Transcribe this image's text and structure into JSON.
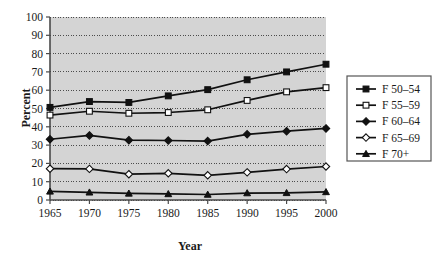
{
  "chart_data": {
    "type": "line",
    "title": "",
    "xlabel": "Year",
    "ylabel": "Percent",
    "categories": [
      1965,
      1970,
      1975,
      1980,
      1985,
      1990,
      1995,
      2000
    ],
    "tick_labels_x": [
      "1965",
      "1970",
      "1975",
      "1980",
      "1985",
      "1990",
      "1995",
      "2000"
    ],
    "tick_labels_y": [
      "0",
      "10",
      "20",
      "30",
      "40",
      "50",
      "60",
      "70",
      "80",
      "90",
      "100"
    ],
    "ylim": [
      0,
      100
    ],
    "xlim": [
      1965,
      2000
    ],
    "y_tick_step": 10,
    "grid": "horizontal-dotted",
    "legend_position": "right-outside",
    "plot_background": "#d4d4d4",
    "series": [
      {
        "name": "F 50–54",
        "marker": "filled-square",
        "values": [
          50.6,
          53.8,
          53.3,
          56.9,
          60.3,
          65.7,
          70.0,
          74.2
        ]
      },
      {
        "name": "F 55–59",
        "marker": "open-square",
        "values": [
          46.4,
          48.5,
          47.4,
          47.8,
          49.3,
          54.4,
          59.1,
          61.4
        ]
      },
      {
        "name": "F 60–64",
        "marker": "filled-diamond",
        "values": [
          33.2,
          35.3,
          32.7,
          32.5,
          32.2,
          35.9,
          37.6,
          39.1
        ]
      },
      {
        "name": "F 65–69",
        "marker": "open-diamond",
        "values": [
          17.1,
          17.0,
          14.1,
          14.6,
          13.5,
          15.1,
          16.9,
          18.3
        ]
      },
      {
        "name": "F 70+",
        "marker": "filled-triangle",
        "values": [
          4.7,
          4.2,
          3.6,
          3.3,
          3.0,
          3.8,
          3.9,
          4.4
        ]
      }
    ],
    "line_color": "#111111",
    "marker_fill_open": "#ffffff"
  },
  "legend": {
    "entries": [
      {
        "label": "F 50–54"
      },
      {
        "label": "F 55–59"
      },
      {
        "label": "F 60–64"
      },
      {
        "label": "F 65–69"
      },
      {
        "label": "F 70+"
      }
    ]
  }
}
